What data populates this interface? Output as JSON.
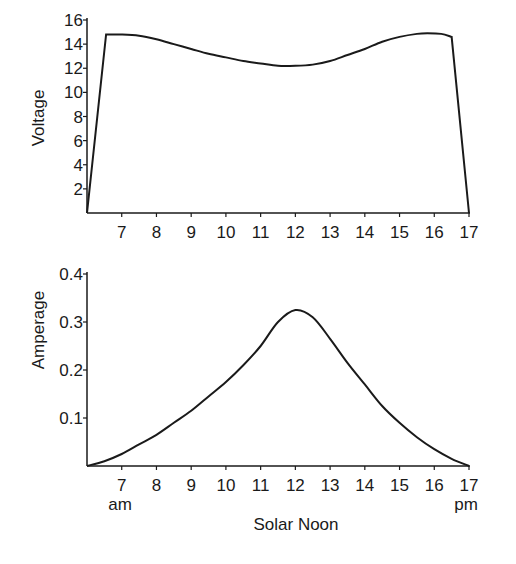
{
  "chart_data": [
    {
      "type": "line",
      "title": "",
      "xlabel": "",
      "ylabel": "Voltage",
      "xlim": [
        6,
        17
      ],
      "ylim": [
        0,
        16
      ],
      "xticks": [
        7,
        8,
        9,
        10,
        11,
        12,
        13,
        14,
        15,
        16,
        17
      ],
      "yticks": [
        2,
        4,
        6,
        8,
        10,
        12,
        14,
        16
      ],
      "grid": false,
      "legend": null,
      "series": [
        {
          "name": "Voltage",
          "x": [
            6.0,
            6.55,
            7.0,
            7.5,
            8.0,
            8.5,
            9.0,
            9.5,
            10.0,
            10.5,
            11.0,
            11.5,
            12.0,
            12.5,
            13.0,
            13.5,
            14.0,
            14.5,
            15.0,
            15.5,
            15.8,
            16.2,
            16.5,
            17.0
          ],
          "y": [
            0.0,
            14.8,
            14.8,
            14.7,
            14.4,
            14.0,
            13.6,
            13.2,
            12.9,
            12.6,
            12.4,
            12.2,
            12.2,
            12.3,
            12.6,
            13.1,
            13.6,
            14.2,
            14.6,
            14.85,
            14.9,
            14.85,
            14.6,
            0.0
          ]
        }
      ]
    },
    {
      "type": "line",
      "title": "",
      "xlabel": "Solar Noon",
      "ylabel": "Amperage",
      "xlim": [
        6,
        17
      ],
      "ylim": [
        0,
        0.4
      ],
      "xticks": [
        7,
        8,
        9,
        10,
        11,
        12,
        13,
        14,
        15,
        16,
        17
      ],
      "yticks": [
        0.1,
        0.2,
        0.3,
        0.4
      ],
      "x_annotations": {
        "start": "am",
        "end": "pm"
      },
      "grid": false,
      "legend": null,
      "series": [
        {
          "name": "Amperage",
          "x": [
            6.0,
            6.5,
            7.0,
            7.5,
            8.0,
            8.5,
            9.0,
            9.5,
            10.0,
            10.5,
            11.0,
            11.5,
            12.0,
            12.5,
            13.0,
            13.5,
            14.0,
            14.5,
            15.0,
            15.5,
            16.0,
            16.5,
            17.0
          ],
          "y": [
            0.0,
            0.01,
            0.025,
            0.045,
            0.065,
            0.09,
            0.115,
            0.145,
            0.175,
            0.21,
            0.25,
            0.3,
            0.325,
            0.31,
            0.265,
            0.215,
            0.17,
            0.125,
            0.09,
            0.06,
            0.035,
            0.015,
            0.0
          ]
        }
      ]
    }
  ],
  "top_chart": {
    "ylabel": "Voltage",
    "ytick_labels": [
      "2",
      "4",
      "6",
      "8",
      "10",
      "12",
      "14",
      "16"
    ],
    "xtick_labels": [
      "7",
      "8",
      "9",
      "10",
      "11",
      "12",
      "13",
      "14",
      "15",
      "16",
      "17"
    ]
  },
  "bottom_chart": {
    "ylabel": "Amperage",
    "ytick_labels": [
      "0.1",
      "0.2",
      "0.3",
      "0.4"
    ],
    "xtick_labels": [
      "7",
      "8",
      "9",
      "10",
      "11",
      "12",
      "13",
      "14",
      "15",
      "16",
      "17"
    ],
    "am_label": "am",
    "pm_label": "pm",
    "xlabel": "Solar Noon"
  }
}
